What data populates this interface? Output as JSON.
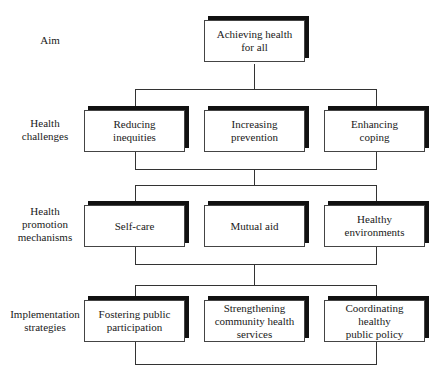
{
  "diagram": {
    "levels": [
      {
        "id": "aim",
        "label": "Aim",
        "nodes": [
          {
            "text": "Achieving health\nfor all"
          }
        ]
      },
      {
        "id": "challenges",
        "label": "Health\nchallenges",
        "nodes": [
          {
            "text": "Reducing\ninequities"
          },
          {
            "text": "Increasing\nprevention"
          },
          {
            "text": "Enhancing\ncoping"
          }
        ]
      },
      {
        "id": "mechanisms",
        "label": "Health\npromotion\nmechanisms",
        "nodes": [
          {
            "text": "Self-care"
          },
          {
            "text": "Mutual aid"
          },
          {
            "text": "Healthy\nenvironments"
          }
        ]
      },
      {
        "id": "strategies",
        "label": "Implementation\nstrategies",
        "nodes": [
          {
            "text": "Fostering public\nparticipation"
          },
          {
            "text": "Strengthening\ncommunity health\nservices"
          },
          {
            "text": "Coordinating healthy\npublic policy"
          }
        ]
      }
    ]
  }
}
